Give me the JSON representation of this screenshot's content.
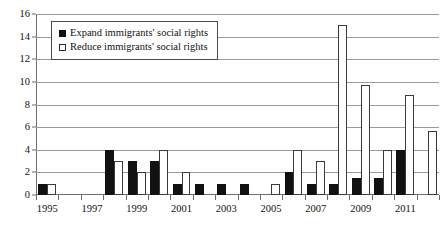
{
  "chart_data": {
    "type": "bar",
    "title": "",
    "subtitle": "",
    "xlabel": "",
    "ylabel": "",
    "grid": true,
    "legend_position": "top-left",
    "ylim": [
      0,
      16
    ],
    "yticks": [
      0,
      2,
      4,
      6,
      8,
      10,
      12,
      14,
      16
    ],
    "ytick_labels": [
      "0",
      "2",
      "4",
      "6",
      "8",
      "10",
      "12",
      "14",
      "16"
    ],
    "categories": [
      "1995",
      "1996",
      "1997",
      "1998",
      "1999",
      "2000",
      "2001",
      "2002",
      "2003",
      "2004",
      "2005",
      "2006",
      "2007",
      "2008",
      "2009",
      "2010",
      "2011",
      "2012"
    ],
    "xtick_labels": [
      "1995",
      "1997",
      "1999",
      "2001",
      "2003",
      "2005",
      "2007",
      "2009",
      "2011"
    ],
    "xticks": [
      "1995",
      "1997",
      "1999",
      "2001",
      "2003",
      "2005",
      "2007",
      "2009",
      "2011"
    ],
    "series": [
      {
        "name": "Expand immigrants' social rights",
        "color": "#111111",
        "values": [
          1,
          0,
          0,
          4,
          3,
          3,
          1,
          1,
          1,
          1,
          0,
          2,
          1,
          1,
          1.5,
          1.5,
          4,
          0
        ]
      },
      {
        "name": "Reduce immigrants' social rights",
        "color": "#ffffff",
        "values": [
          1,
          0,
          0,
          3,
          2,
          4,
          2,
          0,
          0,
          0,
          1,
          4,
          3,
          15,
          9.7,
          4,
          8.8,
          5.7
        ]
      }
    ]
  },
  "legend": {
    "items": [
      {
        "label": "Expand immigrants' social rights",
        "swatch": "filled-square"
      },
      {
        "label": "Reduce immigrants' social rights",
        "swatch": "hollow-square"
      }
    ]
  }
}
